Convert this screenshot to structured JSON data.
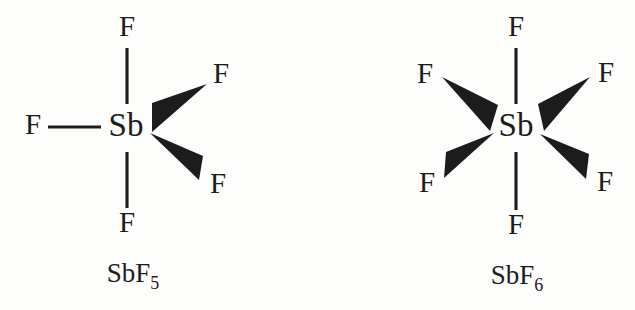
{
  "figure": {
    "background_color": "#fdfdfb",
    "ink_color": "#1c1c1c",
    "structures": [
      {
        "id": "sbf5",
        "caption_main": "SbF",
        "caption_subscript": "5",
        "center_atom": "Sb",
        "geometry": "trigonal bipyramidal",
        "ligands": [
          {
            "label": "F",
            "position": "top",
            "bond_type": "line"
          },
          {
            "label": "F",
            "position": "bottom",
            "bond_type": "line"
          },
          {
            "label": "F",
            "position": "left",
            "bond_type": "line"
          },
          {
            "label": "F",
            "position": "upper-right",
            "bond_type": "wedge"
          },
          {
            "label": "F",
            "position": "lower-right",
            "bond_type": "wedge"
          }
        ]
      },
      {
        "id": "sbf6",
        "caption_main": "SbF",
        "caption_subscript": "6",
        "center_atom": "Sb",
        "geometry": "octahedral",
        "ligands": [
          {
            "label": "F",
            "position": "top",
            "bond_type": "line"
          },
          {
            "label": "F",
            "position": "bottom",
            "bond_type": "line"
          },
          {
            "label": "F",
            "position": "upper-left",
            "bond_type": "wedge"
          },
          {
            "label": "F",
            "position": "upper-right",
            "bond_type": "wedge"
          },
          {
            "label": "F",
            "position": "lower-left",
            "bond_type": "wedge"
          },
          {
            "label": "F",
            "position": "lower-right",
            "bond_type": "wedge"
          }
        ]
      }
    ]
  }
}
